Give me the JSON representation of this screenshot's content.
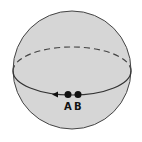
{
  "diagram": {
    "colors": {
      "sphere_fill": "#d6d6d6",
      "stroke": "#333333",
      "point": "#111111"
    },
    "points": [
      {
        "label": "A"
      },
      {
        "label": "B"
      }
    ],
    "equator": {
      "front": "solid",
      "back": "dashed",
      "arrow_direction": "left"
    }
  }
}
